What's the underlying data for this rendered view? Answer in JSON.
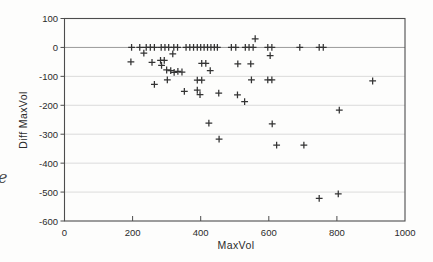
{
  "figure": {
    "stray_text": "e"
  },
  "chart_data": {
    "type": "scatter",
    "marker_glyph": "+",
    "title": "",
    "xlabel": "MaxVol",
    "ylabel": "Diff MaxVol",
    "xlim": [
      0,
      1000
    ],
    "ylim": [
      -600,
      100
    ],
    "x_ticks": [
      0,
      200,
      400,
      600,
      800,
      1000
    ],
    "x_tick_labels": [
      "0",
      "200",
      "400",
      "600",
      "800",
      "1000"
    ],
    "y_ticks": [
      100,
      0,
      -100,
      -200,
      -300,
      -400,
      -500,
      -600
    ],
    "y_tick_labels": [
      "100",
      "0",
      "-100",
      "-200",
      "-300",
      "-400",
      "-500",
      "-600"
    ],
    "grid": "horizontal-light",
    "legend": "none",
    "points": [
      [
        197,
        0
      ],
      [
        221,
        0
      ],
      [
        240,
        0
      ],
      [
        252,
        0
      ],
      [
        264,
        0
      ],
      [
        284,
        0
      ],
      [
        295,
        0
      ],
      [
        306,
        0
      ],
      [
        321,
        0
      ],
      [
        332,
        0
      ],
      [
        357,
        0
      ],
      [
        368,
        0
      ],
      [
        379,
        0
      ],
      [
        390,
        0
      ],
      [
        400,
        0
      ],
      [
        410,
        0
      ],
      [
        420,
        0
      ],
      [
        430,
        0
      ],
      [
        440,
        0
      ],
      [
        449,
        0
      ],
      [
        490,
        0
      ],
      [
        503,
        0
      ],
      [
        531,
        0
      ],
      [
        542,
        0
      ],
      [
        554,
        0
      ],
      [
        597,
        0
      ],
      [
        609,
        0
      ],
      [
        691,
        0
      ],
      [
        748,
        0
      ],
      [
        760,
        0
      ],
      [
        560,
        30
      ],
      [
        233,
        -20
      ],
      [
        318,
        -22
      ],
      [
        604,
        -28
      ],
      [
        195,
        -50
      ],
      [
        257,
        -52
      ],
      [
        282,
        -45
      ],
      [
        293,
        -45
      ],
      [
        285,
        -62
      ],
      [
        403,
        -55
      ],
      [
        415,
        -55
      ],
      [
        509,
        -57
      ],
      [
        547,
        -57
      ],
      [
        300,
        -78
      ],
      [
        312,
        -80
      ],
      [
        322,
        -86
      ],
      [
        333,
        -83
      ],
      [
        345,
        -85
      ],
      [
        428,
        -80
      ],
      [
        302,
        -112
      ],
      [
        390,
        -113
      ],
      [
        403,
        -113
      ],
      [
        549,
        -112
      ],
      [
        597,
        -112
      ],
      [
        609,
        -112
      ],
      [
        905,
        -116
      ],
      [
        264,
        -128
      ],
      [
        352,
        -152
      ],
      [
        390,
        -148
      ],
      [
        398,
        -163
      ],
      [
        453,
        -158
      ],
      [
        508,
        -164
      ],
      [
        529,
        -187
      ],
      [
        807,
        -217
      ],
      [
        424,
        -262
      ],
      [
        610,
        -264
      ],
      [
        454,
        -317
      ],
      [
        623,
        -338
      ],
      [
        703,
        -338
      ],
      [
        748,
        -522
      ],
      [
        804,
        -506
      ]
    ]
  }
}
